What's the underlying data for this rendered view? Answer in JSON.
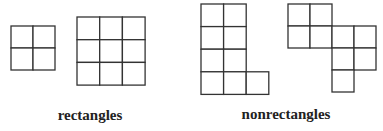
{
  "colors": {
    "stroke": "#333333",
    "text": "#222222",
    "background": "#ffffff"
  },
  "labels": {
    "rectangles": "rectangles",
    "nonrectangles": "nonrectangles"
  },
  "shapes": [
    {
      "name": "rectangle-2x2",
      "group": "rectangles",
      "origin": [
        11,
        26
      ],
      "cell": 22,
      "cells": [
        [
          0,
          0
        ],
        [
          1,
          0
        ],
        [
          0,
          1
        ],
        [
          1,
          1
        ]
      ]
    },
    {
      "name": "rectangle-3x3",
      "group": "rectangles",
      "origin": [
        77,
        17
      ],
      "cell": 22.7,
      "cells": [
        [
          0,
          0
        ],
        [
          1,
          0
        ],
        [
          2,
          0
        ],
        [
          0,
          1
        ],
        [
          1,
          1
        ],
        [
          2,
          1
        ],
        [
          0,
          2
        ],
        [
          1,
          2
        ],
        [
          2,
          2
        ]
      ]
    },
    {
      "name": "nonrectangle-l-shape",
      "group": "nonrectangles",
      "origin": [
        201,
        4
      ],
      "cell": 22.6,
      "cells": [
        [
          0,
          0
        ],
        [
          1,
          0
        ],
        [
          0,
          1
        ],
        [
          1,
          1
        ],
        [
          0,
          2
        ],
        [
          1,
          2
        ],
        [
          0,
          3
        ],
        [
          1,
          3
        ],
        [
          2,
          3
        ]
      ]
    },
    {
      "name": "nonrectangle-stair-shape",
      "group": "nonrectangles",
      "origin": [
        288,
        4
      ],
      "cell": 22,
      "cells": [
        [
          0,
          0
        ],
        [
          1,
          0
        ],
        [
          0,
          1
        ],
        [
          1,
          1
        ],
        [
          2,
          1
        ],
        [
          3,
          1
        ],
        [
          2,
          2
        ],
        [
          3,
          2
        ],
        [
          2,
          3
        ]
      ]
    }
  ]
}
